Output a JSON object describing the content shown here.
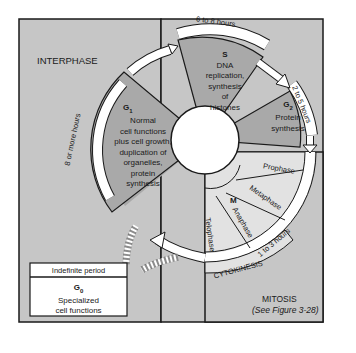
{
  "labels": {
    "interphase": "INTERPHASE",
    "mitosis": "MITOSIS",
    "mitosis_ref": "(See Figure 3-28)",
    "cytokinesis": "CYTOKINESIS"
  },
  "phases": {
    "g1": {
      "name": "G",
      "sub": "1",
      "lines": [
        "Normal",
        "cell functions",
        "plus cell growth,",
        "duplication of",
        "organelles,",
        "protein",
        "synthesis"
      ],
      "duration": "8 or more hours"
    },
    "s": {
      "name": "S",
      "lines": [
        "DNA",
        "replication,",
        "synthesis",
        "of",
        "histones"
      ],
      "duration": "6 to 8 hours"
    },
    "g2": {
      "name": "G",
      "sub": "2",
      "lines": [
        "Protein",
        "synthesis"
      ],
      "duration": "2 to 5 hours"
    },
    "m": {
      "name": "M",
      "stages": [
        "Prophase",
        "Metaphase",
        "Anaphase",
        "Telophase"
      ],
      "duration": "1 to 3 hours"
    },
    "g0": {
      "header": "Indefinite period",
      "name": "G",
      "sub": "0",
      "lines": [
        "Specialized",
        "cell functions"
      ]
    }
  },
  "colors": {
    "background": "#c6c6c6",
    "sector_dark": "#a9a9a9",
    "sector_light": "#e2e2e2",
    "stroke": "#1a1a1a",
    "white": "#ffffff"
  }
}
